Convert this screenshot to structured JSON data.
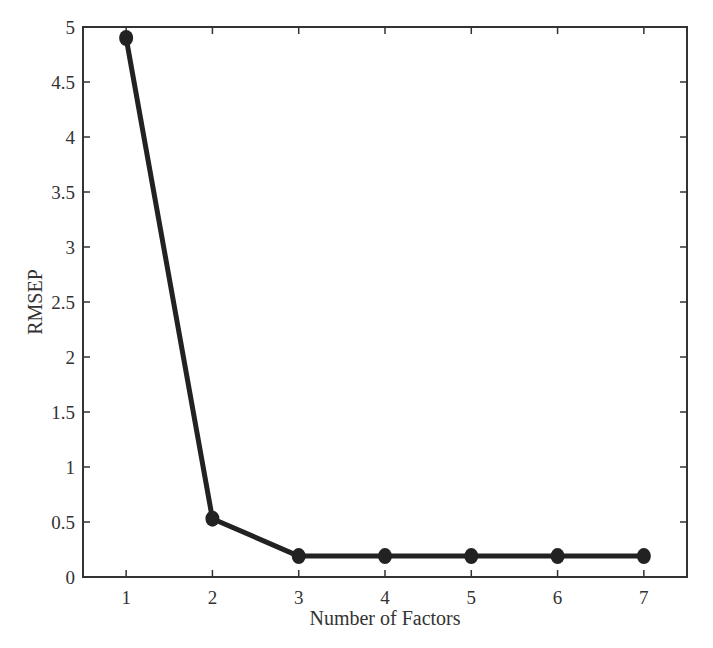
{
  "chart_data": {
    "type": "line",
    "title": "",
    "xlabel": "Number of Factors",
    "ylabel": "RMSEP",
    "x": [
      1,
      2,
      3,
      4,
      5,
      6,
      7
    ],
    "series": [
      {
        "name": "RMSEP",
        "values": [
          4.9,
          0.53,
          0.19,
          0.19,
          0.19,
          0.19,
          0.19
        ]
      }
    ],
    "xlim": [
      0.5,
      7.5
    ],
    "ylim": [
      0,
      5
    ],
    "xticks": [
      1,
      2,
      3,
      4,
      5,
      6,
      7
    ],
    "xtick_labels": [
      "1",
      "2",
      "3",
      "4",
      "5",
      "6",
      "7"
    ],
    "yticks": [
      0,
      0.5,
      1,
      1.5,
      2,
      2.5,
      3,
      3.5,
      4,
      4.5,
      5
    ],
    "ytick_labels": [
      "0",
      "0.5",
      "1",
      "1.5",
      "2",
      "2.5",
      "3",
      "3.5",
      "4",
      "4.5",
      "5"
    ],
    "grid": false,
    "legend": null,
    "colors": {
      "line": "#222222",
      "marker": "#222222",
      "axes": "#333333"
    }
  }
}
